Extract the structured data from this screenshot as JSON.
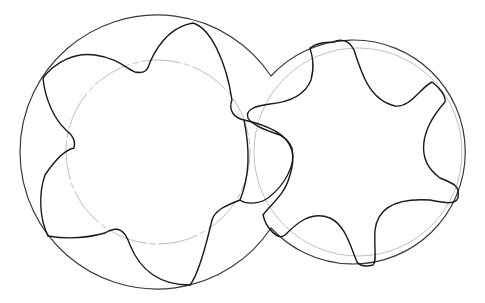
{
  "diagram": {
    "title": "",
    "colors": {
      "profile": "#1a1a1a",
      "housing": "#3a3a3a",
      "pitch_circle": "#b0b0b0",
      "background": "#ffffff"
    },
    "rotors": [
      {
        "name": "left-rotor",
        "lobes": 5,
        "center": [
          158,
          152
        ],
        "housing_radius": 137,
        "pitch_radius": 92
      },
      {
        "name": "right-rotor",
        "lobes": 6,
        "center": [
          358,
          152
        ],
        "housing_radius": 112,
        "pitch_radius": 104
      }
    ]
  }
}
